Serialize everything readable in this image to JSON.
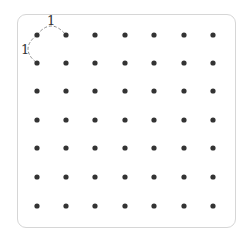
{
  "diagram": {
    "title": "",
    "grid": {
      "rows": 7,
      "cols": 7,
      "dot_color": "#333333"
    },
    "dots_x": [
      37,
      66,
      95,
      125,
      154,
      184,
      213
    ],
    "dots_y": [
      35,
      63,
      91,
      120,
      148,
      177,
      206
    ],
    "labels": {
      "top": "1",
      "left": "1"
    },
    "arc_color": "#888888"
  }
}
